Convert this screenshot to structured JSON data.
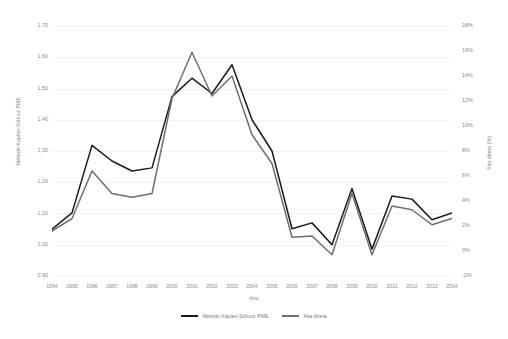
{
  "chart_data": {
    "type": "line",
    "title": "",
    "xlabel": "Ano",
    "ylabel": "Método Kaplan-Schuur PME",
    "ylabel_secondary": "Alta direta (%)",
    "grid": true,
    "legend_position": "bottom",
    "x": [
      1994,
      1995,
      1996,
      1997,
      1998,
      1999,
      2000,
      2001,
      2002,
      2003,
      2004,
      2005,
      2006,
      2007,
      2008,
      2009,
      2010,
      2011,
      2012,
      2013,
      2014
    ],
    "categories": [
      "1994",
      "1995",
      "1996",
      "1997",
      "1998",
      "1999",
      "2000",
      "2001",
      "2002",
      "2003",
      "2004",
      "2005",
      "2006",
      "2007",
      "2008",
      "2009",
      "2010",
      "2011",
      "2012",
      "2013",
      "2014"
    ],
    "ylim": [
      0.9,
      1.7
    ],
    "ylim_secondary": [
      -2,
      18
    ],
    "yticks": [
      "0,90",
      "1,00",
      "1,10",
      "1,20",
      "1,30",
      "1,40",
      "1,50",
      "1,60",
      "1,70"
    ],
    "yticks_secondary": [
      "-2%",
      "0%",
      "2%",
      "4%",
      "6%",
      "8%",
      "10%",
      "12%",
      "14%",
      "16%",
      "18%"
    ],
    "series": [
      {
        "name": "Método Kaplan-Schuur PME",
        "axis": "left",
        "color": "#1a1a1a",
        "values": [
          1.05,
          1.102,
          1.318,
          1.268,
          1.236,
          1.246,
          1.474,
          1.533,
          1.484,
          1.576,
          1.4,
          1.3,
          1.051,
          1.07,
          1.0,
          1.18,
          0.986,
          1.156,
          1.146,
          1.08,
          1.102
        ]
      },
      {
        "name": "Alta direta",
        "axis": "right",
        "color": "#6e6e6e",
        "values": [
          1.6,
          2.6,
          6.4,
          4.6,
          4.3,
          4.6,
          12.2,
          15.9,
          12.4,
          14.0,
          9.3,
          7.0,
          1.1,
          1.2,
          -0.3,
          4.6,
          -0.3,
          3.6,
          3.3,
          2.1,
          2.6
        ]
      }
    ]
  },
  "axes": {
    "x_title": "Ano",
    "y_title_left": "Método Kaplan-Schuur PME",
    "y_title_right": "Alta direta (%)"
  },
  "legend": {
    "items": [
      {
        "label": "Método Kaplan-Schuur PME",
        "color": "#1a1a1a"
      },
      {
        "label": "Alta direta",
        "color": "#6e6e6e"
      }
    ]
  },
  "colors": {
    "background": "#ffffff",
    "grid": "#f2f2f2",
    "tick_text": "#8a8a8a",
    "series_primary": "#1a1a1a",
    "series_secondary": "#6e6e6e"
  }
}
